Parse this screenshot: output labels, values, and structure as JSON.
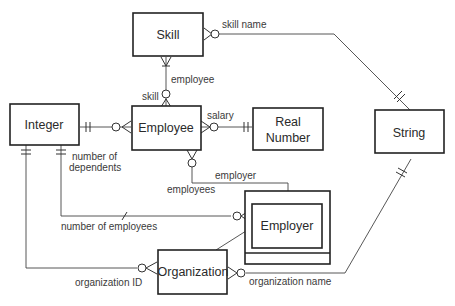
{
  "diagram": {
    "type": "entity-relationship",
    "entities": [
      {
        "id": "skill",
        "label": "Skill"
      },
      {
        "id": "integer",
        "label": "Integer"
      },
      {
        "id": "employee",
        "label": "Employee"
      },
      {
        "id": "real_number",
        "label_line1": "Real",
        "label_line2": "Number"
      },
      {
        "id": "string",
        "label": "String"
      },
      {
        "id": "employer",
        "label": "Employer"
      },
      {
        "id": "organization",
        "label": "Organization"
      }
    ],
    "relationships": [
      {
        "from": "skill",
        "to": "string",
        "label": "skill name"
      },
      {
        "from": "skill",
        "to": "employee",
        "label_a": "employee",
        "label_b": "skill"
      },
      {
        "from": "employee",
        "to": "real_number",
        "label": "salary"
      },
      {
        "from": "employee",
        "to": "integer",
        "label": "number of dependents"
      },
      {
        "from": "employee",
        "to": "employer",
        "label_a": "employees",
        "label_b": "employer"
      },
      {
        "from": "employer",
        "to": "integer",
        "label": "number of employees"
      },
      {
        "from": "organization",
        "to": "integer",
        "label": "organization ID"
      },
      {
        "from": "organization",
        "to": "string",
        "label": "organization name"
      },
      {
        "from": "organization",
        "to": "employer",
        "label": ""
      }
    ]
  },
  "labels": {
    "skill_name": "skill name",
    "employee": "employee",
    "skill": "skill",
    "salary": "salary",
    "number_of": "number of",
    "dependents": "dependents",
    "employer": "employer",
    "employees": "employees",
    "number_of_employees": "number of employees",
    "organization_id": "organization ID",
    "organization_name": "organization name"
  }
}
